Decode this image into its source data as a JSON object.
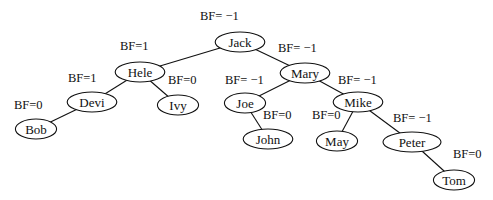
{
  "diagram": {
    "type": "avl-tree",
    "nodes": [
      {
        "id": "jack",
        "label": "Jack",
        "bf": "BF= −1",
        "x": 240,
        "y": 42,
        "bfx": 200,
        "bfy": 20
      },
      {
        "id": "hele",
        "label": "Hele",
        "bf": "BF=1",
        "x": 140,
        "y": 72,
        "bfx": 120,
        "bfy": 50
      },
      {
        "id": "mary",
        "label": "Mary",
        "bf": "BF= −1",
        "x": 305,
        "y": 73,
        "bfx": 278,
        "bfy": 52
      },
      {
        "id": "devi",
        "label": "Devi",
        "bf": "BF=1",
        "x": 92,
        "y": 102,
        "bfx": 68,
        "bfy": 82
      },
      {
        "id": "ivy",
        "label": "Ivy",
        "bf": "BF=0",
        "x": 178,
        "y": 105,
        "bfx": 168,
        "bfy": 84
      },
      {
        "id": "joe",
        "label": "Joe",
        "bf": "BF= −1",
        "x": 245,
        "y": 103,
        "bfx": 225,
        "bfy": 84
      },
      {
        "id": "mike",
        "label": "Mike",
        "bf": "BF= −1",
        "x": 358,
        "y": 102,
        "bfx": 338,
        "bfy": 84
      },
      {
        "id": "bob",
        "label": "Bob",
        "bf": "BF=0",
        "x": 36,
        "y": 129,
        "bfx": 14,
        "bfy": 109
      },
      {
        "id": "john",
        "label": "John",
        "bf": "BF=0",
        "x": 268,
        "y": 139,
        "bfx": 263,
        "bfy": 119
      },
      {
        "id": "may",
        "label": "May",
        "bf": "BF=0",
        "x": 337,
        "y": 141,
        "bfx": 312,
        "bfy": 119
      },
      {
        "id": "peter",
        "label": "Peter",
        "bf": "BF= −1",
        "x": 412,
        "y": 142,
        "bfx": 393,
        "bfy": 122
      },
      {
        "id": "tom",
        "label": "Tom",
        "bf": "BF=0",
        "x": 454,
        "y": 180,
        "bfx": 453,
        "bfy": 158
      }
    ],
    "edges": [
      [
        "jack",
        "hele"
      ],
      [
        "jack",
        "mary"
      ],
      [
        "hele",
        "devi"
      ],
      [
        "hele",
        "ivy"
      ],
      [
        "devi",
        "bob"
      ],
      [
        "mary",
        "joe"
      ],
      [
        "mary",
        "mike"
      ],
      [
        "joe",
        "john"
      ],
      [
        "mike",
        "may"
      ],
      [
        "mike",
        "peter"
      ],
      [
        "peter",
        "tom"
      ]
    ]
  }
}
